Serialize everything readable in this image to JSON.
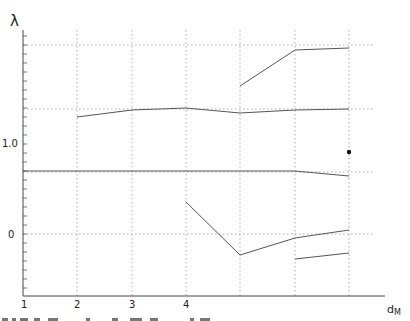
{
  "chart_data": {
    "type": "line",
    "title": "",
    "xlabel": "d_M",
    "ylabel": "λ",
    "x_ticks": [
      "1",
      "2",
      "3",
      "4"
    ],
    "y_tick_labels": [
      {
        "value": 1.0,
        "label": "1.0"
      },
      {
        "value": 0,
        "label": "0"
      }
    ],
    "xlim": [
      1,
      7
    ],
    "ylim": [
      -0.7,
      2.3
    ],
    "grid": {
      "x": [
        2,
        3,
        4,
        5,
        6,
        7
      ],
      "y": [
        0,
        0.69,
        1.39,
        2.1
      ],
      "style": "dotted"
    },
    "series": [
      {
        "name": "branch-1",
        "x": [
          5,
          6,
          7
        ],
        "y": [
          1.64,
          2.04,
          2.07
        ]
      },
      {
        "name": "branch-2",
        "x": [
          2,
          3,
          4,
          5,
          6,
          7
        ],
        "y": [
          1.3,
          1.38,
          1.4,
          1.34,
          1.38,
          1.39
        ]
      },
      {
        "name": "branch-3",
        "x": [
          1,
          2,
          3,
          4,
          5,
          6,
          7
        ],
        "y": [
          0.7,
          0.7,
          0.7,
          0.7,
          0.7,
          0.7,
          0.64
        ]
      },
      {
        "name": "branch-4",
        "x": [
          4,
          5,
          6,
          7
        ],
        "y": [
          0.36,
          -0.23,
          -0.04,
          0.04
        ]
      },
      {
        "name": "branch-5",
        "x": [
          6,
          7
        ],
        "y": [
          -0.28,
          -0.21
        ]
      }
    ],
    "points": [
      {
        "name": "isolated-point",
        "x": 7,
        "y": 0.91
      }
    ],
    "legend": null
  },
  "labels": {
    "y_axis": "λ",
    "x_axis_main": "d",
    "x_axis_sub": "M",
    "y_1": "1.0",
    "y_0": "0",
    "x_1": "1",
    "x_2": "2",
    "x_3": "3",
    "x_4": "4"
  }
}
